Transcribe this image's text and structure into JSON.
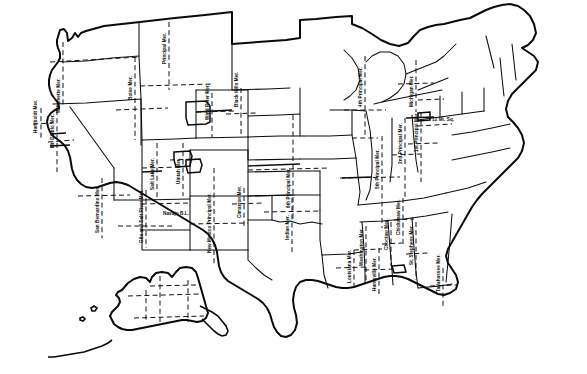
{
  "map": {
    "title": "Principal Meridians and Base Lines of the United States Public Land Survey System",
    "region": "United States including Alaska",
    "line_colors": {
      "state_boundary": "#0d0d0d",
      "coastline": "#0a0a0a",
      "meridian": "#121212",
      "baseline": "#121212"
    },
    "line_styles": {
      "meridian": "dashed",
      "baseline": "dashed",
      "state_boundary": "solid",
      "coastline": "solid-heavy"
    }
  },
  "labels": [
    {
      "id": "willamette",
      "text": "Willamette Mer.",
      "x": 56,
      "y": 113,
      "rot": true
    },
    {
      "id": "humboldt",
      "text": "Humboldt Mer.",
      "x": 33,
      "y": 133,
      "rot": true
    },
    {
      "id": "mt-diablo",
      "text": "Mt. Diablo Mer.",
      "x": 50,
      "y": 148,
      "rot": true
    },
    {
      "id": "san-bern",
      "text": "San Bernardino Mer.",
      "x": 95,
      "y": 233,
      "rot": true
    },
    {
      "id": "gila-salt",
      "text": "Gila and Salt River Mer.",
      "x": 139,
      "y": 243,
      "rot": true
    },
    {
      "id": "boise",
      "text": "Boise Mer.",
      "x": 128,
      "y": 100,
      "rot": true
    },
    {
      "id": "mt-principal",
      "text": "Principal Mer.",
      "x": 162,
      "y": 64,
      "rot": true
    },
    {
      "id": "wind-river",
      "text": "Wind River Mer.",
      "x": 205,
      "y": 120,
      "rot": true
    },
    {
      "id": "salt-lake",
      "text": "Salt Lake Mer.",
      "x": 150,
      "y": 190,
      "rot": true
    },
    {
      "id": "uintah",
      "text": "Uintah Mer.",
      "x": 176,
      "y": 184,
      "rot": true
    },
    {
      "id": "navajo-bl",
      "text": "Navajo B.L.",
      "x": 163,
      "y": 211,
      "rot": false
    },
    {
      "id": "nm-principal",
      "text": "New Mexico Principal Mer.",
      "x": 207,
      "y": 253,
      "rot": true
    },
    {
      "id": "cimarron",
      "text": "Cimarron Mer.",
      "x": 237,
      "y": 218,
      "rot": true
    },
    {
      "id": "black-hills",
      "text": "Black Hills Mer.",
      "x": 234,
      "y": 107,
      "rot": true
    },
    {
      "id": "sixth-principal",
      "text": "6th Principal Mer.",
      "x": 286,
      "y": 208,
      "rot": true
    },
    {
      "id": "indian",
      "text": "Indian Mer.",
      "x": 285,
      "y": 240,
      "rot": true
    },
    {
      "id": "fourth-principal",
      "text": "4th Principal Mer.",
      "x": 358,
      "y": 107,
      "rot": true
    },
    {
      "id": "fifth-principal",
      "text": "5th Principal Mer.",
      "x": 375,
      "y": 189,
      "rot": true
    },
    {
      "id": "second-principal",
      "text": "2nd Principal Mer.",
      "x": 398,
      "y": 164,
      "rot": true
    },
    {
      "id": "first-principal",
      "text": "1st Principal Mer.",
      "x": 414,
      "y": 152,
      "rot": true
    },
    {
      "id": "michigan",
      "text": "Michigan Mer.",
      "x": 409,
      "y": 107,
      "rot": true
    },
    {
      "id": "twelve-mi-sq",
      "text": "12 Mi. Sq.",
      "x": 432,
      "y": 117,
      "rot": false
    },
    {
      "id": "louisiana",
      "text": "Louisiana Mer.",
      "x": 347,
      "y": 283,
      "rot": true
    },
    {
      "id": "washington",
      "text": "Washington Mer.",
      "x": 359,
      "y": 266,
      "rot": true
    },
    {
      "id": "huntsville",
      "text": "Huntsville Mer.",
      "x": 372,
      "y": 291,
      "rot": true
    },
    {
      "id": "choctaw",
      "text": "Choctaw Mer.",
      "x": 384,
      "y": 250,
      "rot": true
    },
    {
      "id": "chickasaw",
      "text": "Chickasaw Mer.",
      "x": 396,
      "y": 235,
      "rot": true
    },
    {
      "id": "st-stephens",
      "text": "St. Stephens Mer.",
      "x": 409,
      "y": 265,
      "rot": true
    },
    {
      "id": "tallahassee",
      "text": "Tallahassee Mer.",
      "x": 436,
      "y": 292,
      "rot": true
    }
  ]
}
